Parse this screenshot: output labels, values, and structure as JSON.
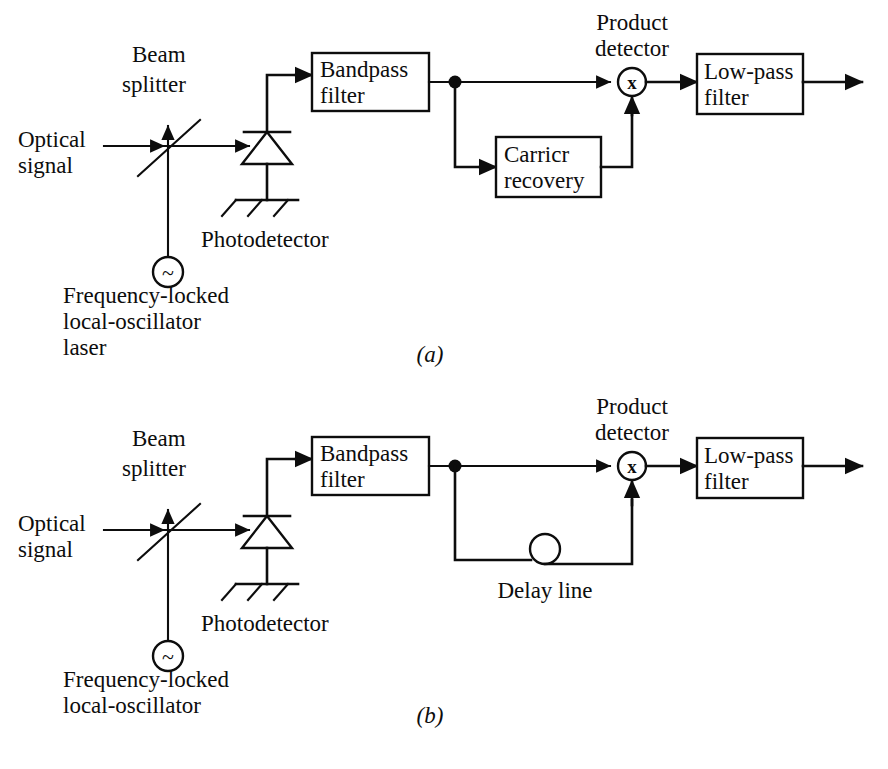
{
  "figure": {
    "background_color": "#ffffff",
    "line_color": "#0d0d0d",
    "width": 888,
    "height": 769
  },
  "panels": [
    {
      "id": "a",
      "label": "(a)",
      "label_x": 430,
      "label_y": 362,
      "name": "synchronous-heterodyne-receiver",
      "labels": {
        "optical_signal_line1": "Optical",
        "optical_signal_line2": "signal",
        "beam_splitter_line1": "Beam",
        "beam_splitter_line2": "splitter",
        "photodetector": "Photodetector",
        "local_oscillator_line1": "Frequency-locked",
        "local_oscillator_line2": "local-oscillator",
        "local_oscillator_line3": "laser",
        "product_detector_line1": "Product",
        "product_detector_line2": "detector"
      },
      "blocks": [
        {
          "name": "bandpass-filter",
          "line1": "Bandpass",
          "line2": "filter",
          "x": 312,
          "y": 53,
          "w": 117,
          "h": 58
        },
        {
          "name": "carrier-recovery",
          "line1": "Carricr",
          "line2": "recovery",
          "x": 496,
          "y": 137,
          "w": 105,
          "h": 60
        },
        {
          "name": "low-pass-filter",
          "line1": "Low-pass",
          "line2": "filter",
          "x": 697,
          "y": 54,
          "w": 106,
          "h": 60
        }
      ],
      "symbols": {
        "product_detector_glyph": "x",
        "oscillator_glyph": "~"
      }
    },
    {
      "id": "b",
      "label": "(b)",
      "label_x": 430,
      "label_y": 723,
      "name": "self-homodyne-delay-line-receiver",
      "labels": {
        "optical_signal_line1": "Optical",
        "optical_signal_line2": "signal",
        "beam_splitter_line1": "Beam",
        "beam_splitter_line2": "splitter",
        "photodetector": "Photodetector",
        "local_oscillator_line1": "Frequency-locked",
        "local_oscillator_line2": "local-oscillator",
        "product_detector_line1": "Product",
        "product_detector_line2": "detector",
        "delay_line": "Delay line"
      },
      "blocks": [
        {
          "name": "bandpass-filter",
          "line1": "Bandpass",
          "line2": "filter",
          "x": 312,
          "y": 437,
          "w": 117,
          "h": 58
        },
        {
          "name": "low-pass-filter",
          "line1": "Low-pass",
          "line2": "filter",
          "x": 697,
          "y": 438,
          "w": 106,
          "h": 60
        }
      ],
      "symbols": {
        "product_detector_glyph": "x",
        "oscillator_glyph": "~"
      }
    }
  ]
}
